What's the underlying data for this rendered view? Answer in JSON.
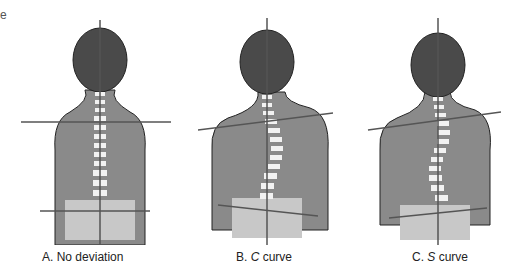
{
  "fragment_text": "e",
  "figures": [
    {
      "id": "A",
      "label_prefix": "A.",
      "label_italic": "",
      "label_rest": "No deviation",
      "spine": "straight",
      "shoulder_tilt": 0,
      "hip_tilt": 0
    },
    {
      "id": "B",
      "label_prefix": "B.",
      "label_italic": "C",
      "label_rest": " curve",
      "spine": "c-curve",
      "shoulder_tilt": -6,
      "hip_tilt": 4
    },
    {
      "id": "C",
      "label_prefix": "C.",
      "label_italic": "S",
      "label_rest": " curve",
      "spine": "s-curve",
      "shoulder_tilt": -7,
      "hip_tilt": -3
    }
  ],
  "colors": {
    "body": "#8a8a8a",
    "hair": "#4a4a4a",
    "pants": "#c8c8c8",
    "line": "#555555",
    "spine": "#f2f2f2"
  }
}
